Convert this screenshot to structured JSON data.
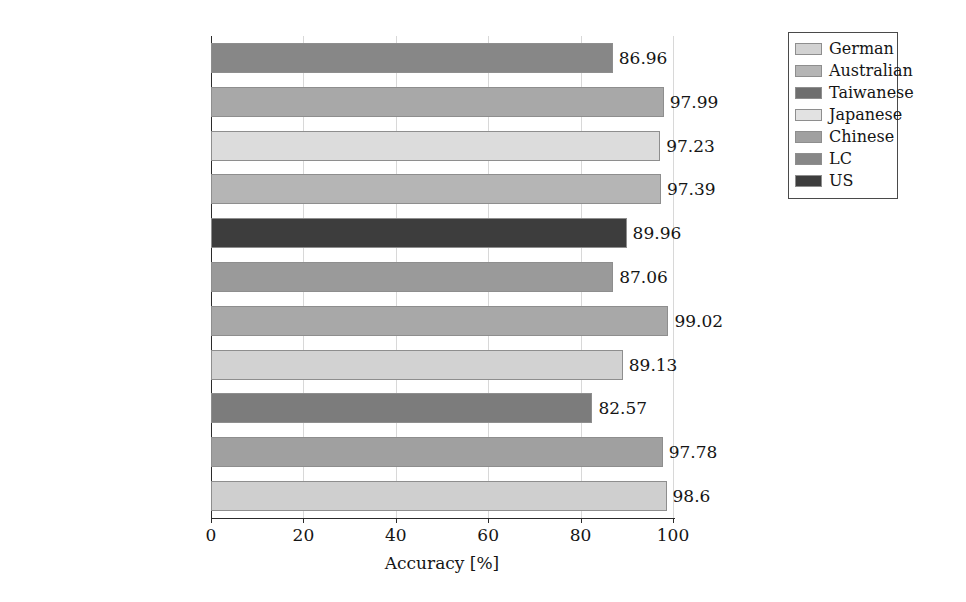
{
  "chart_data": {
    "type": "bar",
    "orientation": "horizontal",
    "title": "",
    "xlabel": "Accuracy [%]",
    "ylabel": "",
    "xlim": [
      0,
      100
    ],
    "xticks": [
      0,
      20,
      40,
      60,
      80,
      100
    ],
    "xtick_labels": [
      "0",
      "20",
      "40",
      "60",
      "80",
      "100"
    ],
    "grid": true,
    "grid_axis": "x",
    "legend_position": "top-right-outside",
    "categories": [
      "Discriminant model",
      "Autoencoder",
      "Autoencoder",
      "Deep ensemble model",
      "TCN",
      "NN",
      "Ensemble ML model",
      "Ensemble ML model",
      "SVM",
      "GA+NN",
      "KNN+SVM"
    ],
    "values": [
      86.96,
      97.99,
      97.23,
      97.39,
      89.96,
      87.06,
      99.02,
      89.13,
      82.57,
      97.78,
      98.6
    ],
    "value_labels": [
      "86.96",
      "97.99",
      "97.23",
      "97.39",
      "89.96",
      "87.06",
      "99.02",
      "89.13",
      "82.57",
      "97.78",
      "98.6"
    ],
    "bar_groups": [
      "LC",
      "Chinese",
      "Japanese",
      "Australian",
      "US",
      "Chinese",
      "Australian",
      "German",
      "LC",
      "Chinese",
      "German"
    ],
    "bar_colors": [
      "#878787",
      "#a8a8a8",
      "#dcdcdc",
      "#b5b5b5",
      "#3d3d3d",
      "#9a9a9a",
      "#a8a8a8",
      "#d2d2d2",
      "#7c7c7c",
      "#a0a0a0",
      "#cfcfcf"
    ],
    "legend": [
      {
        "label": "German",
        "color": "#d2d2d2"
      },
      {
        "label": "Australian",
        "color": "#b5b5b5"
      },
      {
        "label": "Taiwanese",
        "color": "#6e6e6e"
      },
      {
        "label": "Japanese",
        "color": "#e2e2e2"
      },
      {
        "label": "Chinese",
        "color": "#a0a0a0"
      },
      {
        "label": "LC",
        "color": "#878787"
      },
      {
        "label": "US",
        "color": "#3d3d3d"
      }
    ]
  }
}
